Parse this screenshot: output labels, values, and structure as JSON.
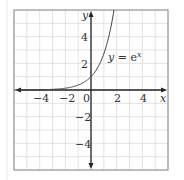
{
  "chart_data": {
    "type": "line",
    "title": "",
    "function": "y = e^x",
    "series": [
      {
        "name": "y = e^x",
        "x": [
          -6,
          -5,
          -4,
          -3,
          -2,
          -1,
          0,
          0.5,
          1,
          1.5,
          1.79
        ],
        "y": [
          0.0025,
          0.0067,
          0.018,
          0.05,
          0.135,
          0.368,
          1,
          1.649,
          2.718,
          4.482,
          6
        ]
      }
    ],
    "xlabel": "x",
    "ylabel": "y",
    "xlim": [
      -6,
      6
    ],
    "ylim": [
      -6,
      6
    ],
    "x_ticks": [
      -4,
      -2,
      0,
      2,
      4
    ],
    "y_ticks": [
      4,
      2,
      -2,
      -4
    ],
    "grid": true,
    "grid_step": 1,
    "annotations": [
      {
        "text": "y = e^x",
        "x": 2.6,
        "y": 2.5
      }
    ],
    "colors": {
      "curve": "#444444",
      "axis": "#222222",
      "grid": "#d8d8d8",
      "border": "#9a9a9a"
    }
  },
  "labels": {
    "x_axis": "x",
    "y_axis": "y",
    "curve_y": "y",
    "curve_eq": " = e",
    "curve_exp": "x",
    "origin": "0",
    "x_ticks": [
      "−4",
      "−2",
      "2",
      "4"
    ],
    "y_ticks": [
      "4",
      "2",
      "−2",
      "−4"
    ]
  }
}
